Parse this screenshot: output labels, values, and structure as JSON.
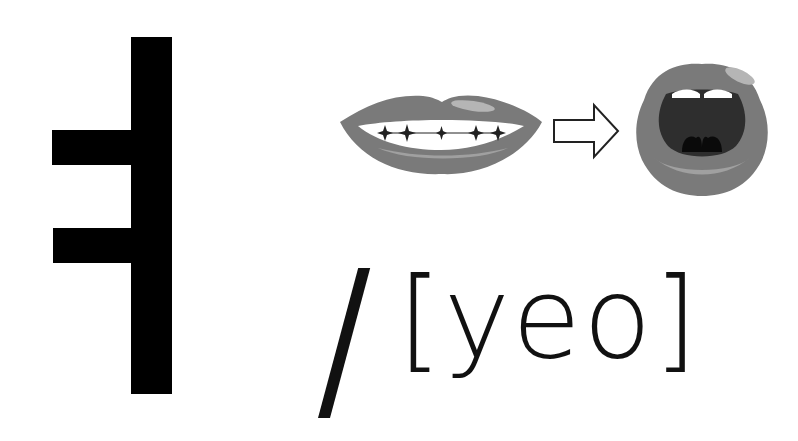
{
  "letter": {
    "hangul": "ㅕ",
    "romanization": "[yeo]",
    "separator": "/"
  },
  "illustration": {
    "from": "closed-smiling-lips",
    "arrow": "right-arrow",
    "to": "open-mouth"
  },
  "colors": {
    "lip": "#7a7a7a",
    "lip_highlight": "#b5b5b5",
    "mouth_interior": "#2e2e2e",
    "tongue": "#0a0a0a",
    "glyph": "#000000",
    "background": "#ffffff"
  }
}
